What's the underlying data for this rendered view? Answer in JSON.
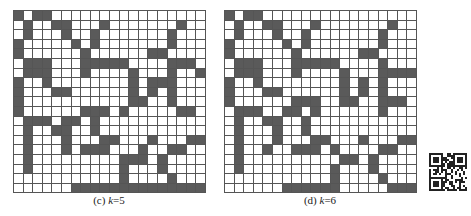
{
  "figure": {
    "panels": [
      {
        "id": "c",
        "caption_label": "(c)",
        "caption_var": "k",
        "caption_value": "=5",
        "rows": 19,
        "cols": 20,
        "grid": [
          "10110000000000000000",
          "01001100010000000100",
          "01000100100000001000",
          "10000010100000001000",
          "10000001000000110000",
          "01110001111100001110",
          "01110001000010001001",
          "10010000000010111000",
          "10001100000010101000",
          "10000000000011001000",
          "10000001110100000110",
          "01110110100000000000",
          "01001100100000000000",
          "01000100011000100011",
          "01000101110001001100",
          "01000000000111010000",
          "01000000000100010000",
          "00000000000100001000",
          "00000011111111111111"
        ]
      },
      {
        "id": "d",
        "caption_label": "(d)",
        "caption_var": "k",
        "caption_value": "=6",
        "rows": 19,
        "cols": 20,
        "grid": [
          "10110000000000000000",
          "01001100010000000100",
          "01000100100000001000",
          "10000010100000001000",
          "10000001000000110000",
          "01110001111100001000",
          "01110001000010001111",
          "10010000000010101000",
          "10001100000010101000",
          "10000001110011001110",
          "01110011010000001000",
          "01001100100000000000",
          "01000100100000000000",
          "01000100011000100011",
          "01001001110100001100",
          "01000000000011010000",
          "01000000000100010000",
          "00000000000100001000",
          "00000011111100000111"
        ]
      }
    ],
    "qr_code": {
      "present": true,
      "label": "qr-code"
    }
  }
}
